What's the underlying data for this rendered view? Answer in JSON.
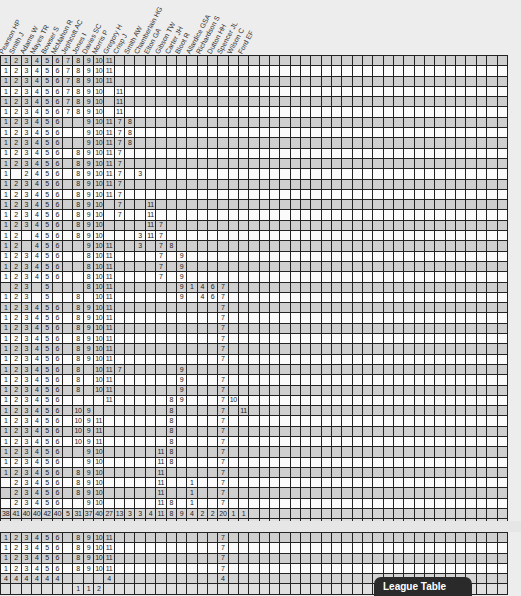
{
  "page": {
    "footer_tab": "League Table",
    "colors": {
      "row_shaded": "#cfcfcf",
      "row_plain": "#fbfbfb",
      "grid_line": "#222222",
      "tab_bg": "#2a2a2a"
    }
  },
  "players": [
    "Pearson HP",
    "Smith J",
    "Adams W",
    "Mayes TR",
    "Bowser S",
    "McMahon R",
    "Jephcott AC",
    "Jones I",
    "Davies SC",
    "Morris P",
    "Gregory H",
    "Crisp J",
    "Smith AW",
    "Chamberlain HG",
    "Elton GA",
    "Gibson TW",
    "Carter JH",
    "Bloot R",
    "Allardice GSA",
    "Richardson S",
    "Dutton HH",
    "Spencer JL",
    "Wilson C",
    "Ford EF"
  ],
  "total_columns": 49,
  "grid1": {
    "rows": [
      [
        "1",
        "2",
        "3",
        "4",
        "5",
        "6",
        "7",
        "8",
        "9",
        "10",
        "11"
      ],
      [
        "1",
        "2",
        "3",
        "4",
        "5",
        "6",
        "7",
        "8",
        "9",
        "10",
        "11"
      ],
      [
        "1",
        "2",
        "3",
        "4",
        "5",
        "6",
        "7",
        "8",
        "9",
        "10",
        "11"
      ],
      [
        "1",
        "2",
        "3",
        "4",
        "5",
        "6",
        "7",
        "8",
        "9",
        "10",
        "",
        "11"
      ],
      [
        "1",
        "2",
        "3",
        "4",
        "5",
        "6",
        "7",
        "8",
        "9",
        "10",
        "",
        "11"
      ],
      [
        "1",
        "2",
        "3",
        "4",
        "5",
        "6",
        "7",
        "8",
        "9",
        "10",
        "",
        "11"
      ],
      [
        "1",
        "2",
        "3",
        "4",
        "5",
        "6",
        "",
        "",
        "9",
        "10",
        "11",
        "7",
        "8"
      ],
      [
        "1",
        "2",
        "3",
        "4",
        "5",
        "6",
        "",
        "",
        "9",
        "10",
        "11",
        "7",
        "8"
      ],
      [
        "1",
        "2",
        "3",
        "4",
        "5",
        "6",
        "",
        "",
        "9",
        "10",
        "11",
        "7",
        "8"
      ],
      [
        "1",
        "2",
        "3",
        "4",
        "5",
        "6",
        "",
        "8",
        "9",
        "10",
        "11",
        "7"
      ],
      [
        "1",
        "2",
        "3",
        "4",
        "5",
        "6",
        "",
        "8",
        "9",
        "10",
        "11",
        "7"
      ],
      [
        "1",
        "",
        "2",
        "4",
        "5",
        "6",
        "",
        "8",
        "9",
        "10",
        "11",
        "7",
        "",
        "3"
      ],
      [
        "1",
        "2",
        "3",
        "4",
        "5",
        "6",
        "",
        "8",
        "9",
        "10",
        "11",
        "7"
      ],
      [
        "1",
        "2",
        "3",
        "4",
        "5",
        "6",
        "",
        "8",
        "9",
        "10",
        "11",
        "7"
      ],
      [
        "1",
        "2",
        "3",
        "4",
        "5",
        "6",
        "",
        "8",
        "9",
        "10",
        "",
        "7",
        "",
        "",
        "11"
      ],
      [
        "1",
        "2",
        "3",
        "4",
        "5",
        "6",
        "",
        "8",
        "9",
        "10",
        "",
        "7",
        "",
        "",
        "11"
      ],
      [
        "1",
        "2",
        "3",
        "4",
        "5",
        "6",
        "",
        "8",
        "9",
        "10",
        "",
        "",
        "",
        "",
        "11",
        "7"
      ],
      [
        "1",
        "2",
        "",
        "4",
        "5",
        "6",
        "",
        "8",
        "9",
        "10",
        "",
        "",
        "",
        "3",
        "11",
        "7"
      ],
      [
        "1",
        "2",
        "",
        "4",
        "5",
        "6",
        "",
        "",
        "9",
        "10",
        "11",
        "",
        "",
        "3",
        "",
        "7",
        "8"
      ],
      [
        "1",
        "2",
        "3",
        "4",
        "5",
        "6",
        "",
        "",
        "8",
        "10",
        "11",
        "",
        "",
        "",
        "",
        "7",
        "",
        "9"
      ],
      [
        "1",
        "2",
        "3",
        "4",
        "5",
        "6",
        "",
        "",
        "8",
        "10",
        "11",
        "",
        "",
        "",
        "",
        "7",
        "",
        "9"
      ],
      [
        "1",
        "2",
        "3",
        "4",
        "5",
        "6",
        "",
        "",
        "8",
        "10",
        "11",
        "",
        "",
        "",
        "",
        "7",
        "",
        "9"
      ],
      [
        "",
        "2",
        "3",
        "",
        "5",
        "",
        "",
        "",
        "8",
        "10",
        "11",
        "",
        "",
        "",
        "",
        "",
        "",
        "9",
        "1",
        "4",
        "6",
        "7"
      ],
      [
        "1",
        "2",
        "3",
        "",
        "5",
        "",
        "",
        "8",
        "",
        "10",
        "11",
        "",
        "",
        "",
        "",
        "",
        "",
        "9",
        "",
        "4",
        "6",
        "7"
      ],
      [
        "1",
        "2",
        "3",
        "4",
        "5",
        "6",
        "",
        "8",
        "9",
        "10",
        "11",
        "",
        "",
        "",
        "",
        "",
        "",
        "",
        "",
        "",
        "",
        "7"
      ],
      [
        "1",
        "2",
        "3",
        "4",
        "5",
        "6",
        "",
        "8",
        "9",
        "10",
        "11",
        "",
        "",
        "",
        "",
        "",
        "",
        "",
        "",
        "",
        "",
        "7"
      ],
      [
        "1",
        "2",
        "3",
        "4",
        "5",
        "6",
        "",
        "8",
        "9",
        "10",
        "11",
        "",
        "",
        "",
        "",
        "",
        "",
        "",
        "",
        "",
        "",
        "7"
      ],
      [
        "1",
        "2",
        "3",
        "4",
        "5",
        "6",
        "",
        "8",
        "9",
        "10",
        "11",
        "",
        "",
        "",
        "",
        "",
        "",
        "",
        "",
        "",
        "",
        "7"
      ],
      [
        "1",
        "2",
        "3",
        "4",
        "5",
        "6",
        "",
        "8",
        "9",
        "10",
        "11",
        "",
        "",
        "",
        "",
        "",
        "",
        "",
        "",
        "",
        "",
        "7"
      ],
      [
        "1",
        "2",
        "3",
        "4",
        "5",
        "6",
        "",
        "8",
        "9",
        "10",
        "11",
        "",
        "",
        "",
        "",
        "",
        "",
        "",
        "",
        "",
        "",
        "7"
      ],
      [
        "1",
        "2",
        "3",
        "4",
        "5",
        "6",
        "",
        "8",
        "",
        "10",
        "11",
        "7",
        "",
        "",
        "",
        "",
        "",
        "9"
      ],
      [
        "1",
        "2",
        "3",
        "4",
        "5",
        "6",
        "",
        "8",
        "",
        "10",
        "11",
        "",
        "",
        "",
        "",
        "",
        "",
        "9",
        "",
        "",
        "",
        "7"
      ],
      [
        "1",
        "2",
        "3",
        "4",
        "5",
        "6",
        "",
        "8",
        "",
        "10",
        "11",
        "",
        "",
        "",
        "",
        "",
        "",
        "9",
        "",
        "",
        "",
        "7"
      ],
      [
        "1",
        "2",
        "3",
        "4",
        "5",
        "6",
        "",
        "",
        "",
        "",
        "11",
        "",
        "",
        "",
        "",
        "",
        "8",
        "9",
        "",
        "",
        "",
        "7",
        "10"
      ],
      [
        "1",
        "2",
        "3",
        "4",
        "5",
        "6",
        "",
        "10",
        "9",
        "",
        "",
        "",
        "",
        "",
        "",
        "",
        "8",
        "",
        "",
        "",
        "",
        "7",
        "",
        "11"
      ],
      [
        "1",
        "2",
        "3",
        "4",
        "5",
        "6",
        "",
        "10",
        "9",
        "11",
        "",
        "",
        "",
        "",
        "",
        "",
        "8",
        "",
        "",
        "",
        "",
        "7"
      ],
      [
        "1",
        "2",
        "3",
        "4",
        "5",
        "6",
        "",
        "10",
        "9",
        "11",
        "",
        "",
        "",
        "",
        "",
        "",
        "8",
        "",
        "",
        "",
        "",
        "7"
      ],
      [
        "1",
        "2",
        "3",
        "4",
        "5",
        "6",
        "",
        "10",
        "9",
        "11",
        "",
        "",
        "",
        "",
        "",
        "",
        "8",
        "",
        "",
        "",
        "",
        "7"
      ],
      [
        "1",
        "2",
        "3",
        "4",
        "5",
        "6",
        "",
        "",
        "9",
        "10",
        "",
        "",
        "",
        "",
        "",
        "11",
        "8",
        "",
        "",
        "",
        "",
        "7"
      ],
      [
        "1",
        "2",
        "3",
        "4",
        "5",
        "6",
        "",
        "",
        "9",
        "10",
        "",
        "",
        "",
        "",
        "",
        "11",
        "8",
        "",
        "",
        "",
        "",
        "7"
      ],
      [
        "1",
        "2",
        "3",
        "4",
        "5",
        "6",
        "",
        "8",
        "9",
        "10",
        "",
        "",
        "",
        "",
        "",
        "11",
        "",
        "",
        "",
        "",
        "",
        "7"
      ],
      [
        "",
        "2",
        "3",
        "4",
        "5",
        "6",
        "",
        "8",
        "9",
        "10",
        "",
        "",
        "",
        "",
        "",
        "11",
        "",
        "",
        "1",
        "",
        "",
        "7"
      ],
      [
        "",
        "2",
        "3",
        "4",
        "5",
        "6",
        "",
        "8",
        "9",
        "10",
        "",
        "",
        "",
        "",
        "",
        "11",
        "",
        "",
        "1",
        "",
        "",
        "7"
      ],
      [
        "",
        "2",
        "3",
        "4",
        "5",
        "6",
        "",
        "",
        "9",
        "10",
        "",
        "",
        "",
        "",
        "",
        "11",
        "8",
        "",
        "1",
        "",
        "",
        "7"
      ]
    ],
    "appearances": [
      "38",
      "41",
      "40",
      "40",
      "42",
      "40",
      "5",
      "31",
      "37",
      "40",
      "27",
      "13",
      "3",
      "3",
      "4",
      "11",
      "8",
      "9",
      "4",
      "2",
      "2",
      "20",
      "1",
      "1"
    ],
    "goals": [
      "",
      "",
      "",
      "",
      "1",
      "",
      "",
      "3",
      "20",
      "14",
      "7",
      "3",
      "1",
      "",
      "",
      "",
      "3",
      "4",
      "",
      "",
      "",
      "2"
    ]
  },
  "grid2": {
    "rows": [
      [
        "1",
        "2",
        "3",
        "4",
        "5",
        "6",
        "",
        "8",
        "9",
        "10",
        "11",
        "",
        "",
        "",
        "",
        "",
        "",
        "",
        "",
        "",
        "",
        "7"
      ],
      [
        "1",
        "2",
        "3",
        "4",
        "5",
        "6",
        "",
        "8",
        "9",
        "10",
        "11",
        "",
        "",
        "",
        "",
        "",
        "",
        "",
        "",
        "",
        "",
        "7"
      ],
      [
        "1",
        "2",
        "3",
        "4",
        "5",
        "6",
        "",
        "8",
        "9",
        "10",
        "11",
        "",
        "",
        "",
        "",
        "",
        "",
        "",
        "",
        "",
        "",
        "7"
      ],
      [
        "1",
        "2",
        "3",
        "4",
        "5",
        "6",
        "",
        "8",
        "9",
        "10",
        "11",
        "",
        "",
        "",
        "",
        "",
        "",
        "",
        "",
        "",
        "",
        "7"
      ]
    ],
    "appearances": [
      "4",
      "4",
      "4",
      "4",
      "4",
      "4",
      "",
      "",
      "",
      "",
      "4",
      "",
      "",
      "",
      "",
      "",
      "",
      "",
      "",
      "",
      "",
      "4"
    ],
    "goals": [
      "",
      "",
      "",
      "",
      "",
      "",
      "",
      "1",
      "1",
      "2"
    ]
  }
}
